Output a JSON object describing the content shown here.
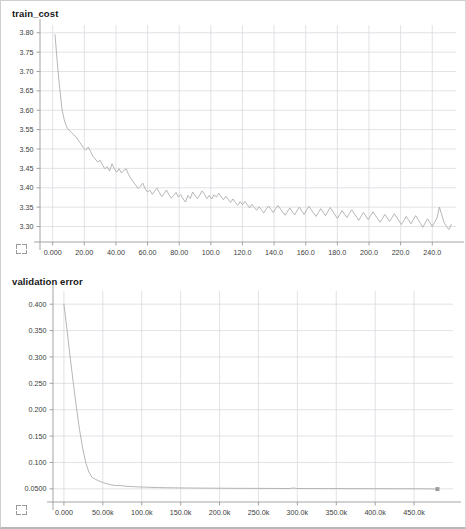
{
  "page": {
    "background": "#ffffff",
    "border_color": "#cfcfcf"
  },
  "style": {
    "grid_color": "#d6d6dc",
    "axis_color": "#9a9a9a",
    "line_color": "#a9a9a9",
    "tick_text_color": "#3c3c3c"
  },
  "panels": [
    {
      "title": "train_cost",
      "expand_icon": "expand-icon"
    },
    {
      "title": "validation error",
      "expand_icon": "expand-icon"
    }
  ],
  "chart_data": [
    {
      "type": "line",
      "title": "train_cost",
      "xlabel": "",
      "ylabel": "",
      "grid": true,
      "legend": "none",
      "xlim": [
        -8,
        255
      ],
      "ylim": [
        3.26,
        3.82
      ],
      "xticks": [
        0,
        20,
        40,
        60,
        80,
        100,
        120,
        140,
        160,
        180,
        200,
        220,
        240
      ],
      "xticklabels": [
        "0.000",
        "20.00",
        "40.00",
        "60.00",
        "80.00",
        "100.0",
        "120.0",
        "140.0",
        "160.0",
        "180.0",
        "200.0",
        "220.0",
        "240.0"
      ],
      "yticks": [
        3.3,
        3.35,
        3.4,
        3.45,
        3.5,
        3.55,
        3.6,
        3.65,
        3.7,
        3.75,
        3.8
      ],
      "yticklabels": [
        "3.30",
        "3.35",
        "3.40",
        "3.45",
        "3.50",
        "3.55",
        "3.60",
        "3.65",
        "3.70",
        "3.75",
        "3.80"
      ],
      "series": [
        {
          "name": "train_cost",
          "x": [
            1.5,
            3,
            4.5,
            6,
            7.5,
            9,
            10.5,
            12,
            13.5,
            15,
            16.5,
            18,
            19.5,
            21,
            22.5,
            24,
            25.5,
            27,
            28.5,
            30,
            31.5,
            33,
            34.5,
            36,
            37.5,
            39,
            40.5,
            42,
            43.5,
            45,
            46.5,
            48,
            49.5,
            51,
            52.5,
            54,
            55.5,
            57,
            58.5,
            60,
            61.5,
            63,
            64.5,
            66,
            67.5,
            69,
            70.5,
            72,
            73.5,
            75,
            76.5,
            78,
            79.5,
            81,
            82.5,
            84,
            85.5,
            87,
            88.5,
            90,
            91.5,
            93,
            94.5,
            96,
            97.5,
            99,
            100.5,
            102,
            103.5,
            105,
            106.5,
            108,
            109.5,
            111,
            112.5,
            114,
            115.5,
            117,
            118.5,
            120,
            121.5,
            123,
            124.5,
            126,
            127.5,
            129,
            130.5,
            132,
            133.5,
            135,
            136.5,
            138,
            139.5,
            141,
            142.5,
            144,
            145.5,
            147,
            148.5,
            150,
            151.5,
            153,
            154.5,
            156,
            157.5,
            159,
            160.5,
            162,
            163.5,
            165,
            166.5,
            168,
            169.5,
            171,
            172.5,
            174,
            175.5,
            177,
            178.5,
            180,
            181.5,
            183,
            184.5,
            186,
            187.5,
            189,
            190.5,
            192,
            193.5,
            195,
            196.5,
            198,
            199.5,
            201,
            202.5,
            204,
            205.5,
            207,
            208.5,
            210,
            211.5,
            213,
            214.5,
            216,
            217.5,
            219,
            220.5,
            222,
            223.5,
            225,
            226.5,
            228,
            229.5,
            231,
            232.5,
            234,
            235.5,
            237,
            238.5,
            240,
            241.5,
            243,
            244.5,
            246,
            247.5,
            249,
            250.5,
            252
          ],
          "y": [
            3.795,
            3.72,
            3.655,
            3.6,
            3.572,
            3.556,
            3.548,
            3.542,
            3.536,
            3.53,
            3.521,
            3.512,
            3.503,
            3.497,
            3.505,
            3.493,
            3.481,
            3.474,
            3.466,
            3.471,
            3.459,
            3.449,
            3.455,
            3.443,
            3.462,
            3.449,
            3.44,
            3.449,
            3.438,
            3.445,
            3.449,
            3.434,
            3.424,
            3.415,
            3.407,
            3.398,
            3.404,
            3.412,
            3.397,
            3.389,
            3.394,
            3.383,
            3.392,
            3.399,
            3.387,
            3.377,
            3.385,
            3.394,
            3.382,
            3.373,
            3.38,
            3.388,
            3.376,
            3.382,
            3.371,
            3.363,
            3.38,
            3.372,
            3.389,
            3.38,
            3.372,
            3.381,
            3.392,
            3.383,
            3.372,
            3.38,
            3.371,
            3.382,
            3.376,
            3.386,
            3.377,
            3.369,
            3.378,
            3.37,
            3.362,
            3.371,
            3.362,
            3.355,
            3.364,
            3.356,
            3.365,
            3.357,
            3.348,
            3.357,
            3.349,
            3.342,
            3.351,
            3.343,
            3.335,
            3.345,
            3.353,
            3.344,
            3.336,
            3.346,
            3.354,
            3.345,
            3.337,
            3.329,
            3.339,
            3.348,
            3.338,
            3.33,
            3.341,
            3.35,
            3.34,
            3.331,
            3.342,
            3.352,
            3.343,
            3.334,
            3.326,
            3.336,
            3.346,
            3.337,
            3.328,
            3.339,
            3.349,
            3.34,
            3.33,
            3.321,
            3.331,
            3.341,
            3.332,
            3.323,
            3.333,
            3.343,
            3.334,
            3.325,
            3.316,
            3.326,
            3.336,
            3.327,
            3.318,
            3.328,
            3.338,
            3.329,
            3.32,
            3.311,
            3.321,
            3.331,
            3.322,
            3.313,
            3.323,
            3.333,
            3.324,
            3.314,
            3.305,
            3.315,
            3.326,
            3.317,
            3.307,
            3.318,
            3.328,
            3.318,
            3.308,
            3.298,
            3.309,
            3.32,
            3.31,
            3.3,
            3.311,
            3.322,
            3.35,
            3.33,
            3.31,
            3.3,
            3.292,
            3.305,
            3.298
          ]
        }
      ]
    },
    {
      "type": "line",
      "title": "validation error",
      "xlabel": "",
      "ylabel": "",
      "grid": true,
      "legend": "none",
      "xlim": [
        -14000,
        500000
      ],
      "ylim": [
        0.025,
        0.425
      ],
      "xticks": [
        0,
        50000,
        100000,
        150000,
        200000,
        250000,
        300000,
        350000,
        400000,
        450000
      ],
      "xticklabels": [
        "0.000",
        "50.00k",
        "100.0k",
        "150.0k",
        "200.0k",
        "250.0k",
        "300.0k",
        "350.0k",
        "400.0k",
        "450.0k"
      ],
      "yticks": [
        0.05,
        0.1,
        0.15,
        0.2,
        0.25,
        0.3,
        0.35,
        0.4
      ],
      "yticklabels": [
        "0.0500",
        "0.100",
        "0.150",
        "0.200",
        "0.250",
        "0.300",
        "0.350",
        "0.400"
      ],
      "end_marker": {
        "x": 480000,
        "y": 0.0495,
        "shape": "square"
      },
      "series": [
        {
          "name": "validation error",
          "x": [
            0,
            4000,
            8000,
            12000,
            16000,
            20000,
            24000,
            28000,
            32000,
            36000,
            40000,
            44000,
            48000,
            52000,
            56000,
            60000,
            64000,
            68000,
            72000,
            76000,
            80000,
            88000,
            96000,
            104000,
            112000,
            120000,
            130000,
            140000,
            150000,
            160000,
            170000,
            180000,
            190000,
            200000,
            210000,
            220000,
            230000,
            240000,
            250000,
            260000,
            270000,
            280000,
            290000,
            295000,
            300000,
            310000,
            320000,
            330000,
            340000,
            350000,
            360000,
            370000,
            380000,
            390000,
            400000,
            410000,
            420000,
            430000,
            440000,
            450000,
            460000,
            470000,
            480000
          ],
          "y": [
            0.4,
            0.352,
            0.3,
            0.252,
            0.205,
            0.163,
            0.128,
            0.1,
            0.082,
            0.072,
            0.0685,
            0.0655,
            0.063,
            0.061,
            0.0592,
            0.0578,
            0.0568,
            0.056,
            0.0563,
            0.0556,
            0.0548,
            0.0542,
            0.0536,
            0.0532,
            0.0528,
            0.0524,
            0.0521,
            0.0519,
            0.0517,
            0.0516,
            0.0514,
            0.0513,
            0.0512,
            0.0511,
            0.051,
            0.0509,
            0.0509,
            0.0508,
            0.0508,
            0.0507,
            0.0507,
            0.0506,
            0.0506,
            0.0516,
            0.0506,
            0.0505,
            0.0505,
            0.0504,
            0.0504,
            0.0504,
            0.0503,
            0.0503,
            0.0503,
            0.0502,
            0.0502,
            0.0502,
            0.0501,
            0.0501,
            0.0501,
            0.05,
            0.05,
            0.0498,
            0.0495
          ]
        }
      ]
    }
  ]
}
